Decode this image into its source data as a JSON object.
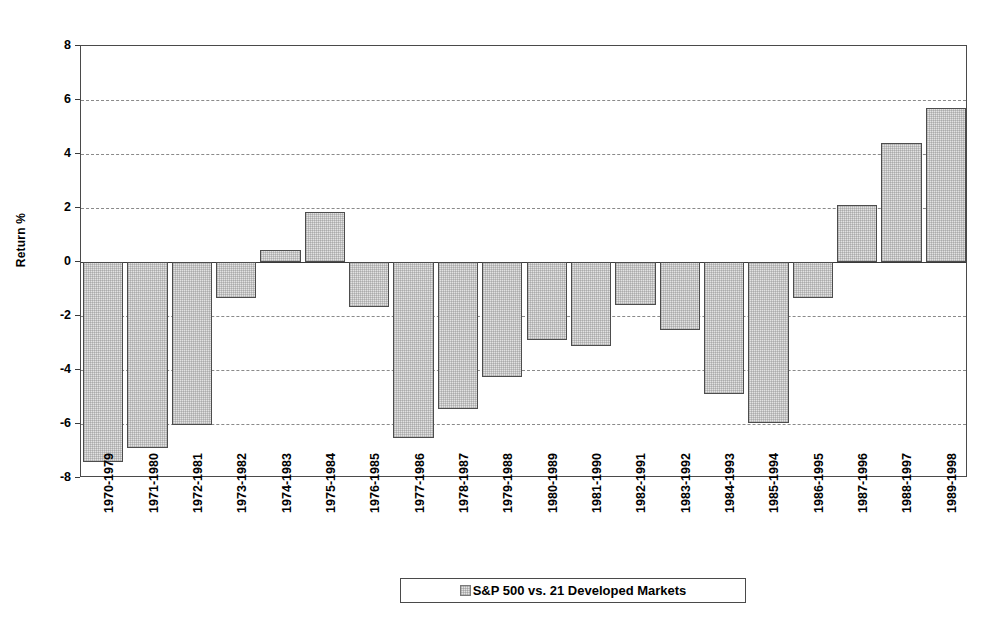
{
  "chart_data": {
    "type": "bar",
    "title": "",
    "subtitle": "",
    "xlabel": "",
    "ylabel": "Return %",
    "ylim": [
      -8,
      8
    ],
    "yticks": [
      8,
      6,
      4,
      2,
      0,
      -2,
      -4,
      -6,
      -8
    ],
    "ytick_labels": [
      "8",
      "6",
      "4",
      "2",
      "0",
      "-2",
      "-4",
      "-6",
      "-8"
    ],
    "grid": true,
    "grid_style": "dashed horizontal",
    "legend_position": "bottom-center",
    "categories": [
      "1970-1979",
      "1971-1980",
      "1972-1981",
      "1973-1982",
      "1974-1983",
      "1975-1984",
      "1976-1985",
      "1977-1986",
      "1978-1987",
      "1979-1988",
      "1980-1989",
      "1981-1990",
      "1982-1991",
      "1983-1992",
      "1984-1993",
      "1985-1994",
      "1986-1995",
      "1987-1996",
      "1988-1997",
      "1989-1998"
    ],
    "series": [
      {
        "name": "S&P 500 vs. 21 Developed Markets",
        "color": "#e2e2e2",
        "edge_color": "#4d4d4d",
        "values": [
          -7.4,
          -6.9,
          -6.05,
          -1.35,
          0.45,
          1.85,
          -1.65,
          -6.5,
          -5.45,
          -4.25,
          -2.9,
          -3.1,
          -1.6,
          -2.5,
          -4.9,
          -5.95,
          -1.35,
          2.1,
          4.4,
          5.7
        ]
      }
    ],
    "legend": [
      {
        "label": "S&P 500 vs. 21 Developed Markets",
        "swatch": "#e2e2e2"
      }
    ]
  }
}
